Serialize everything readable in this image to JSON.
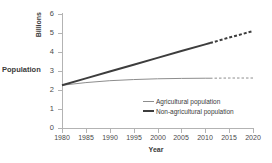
{
  "chart_data": {
    "type": "line",
    "title": "",
    "xlabel": "Year",
    "ylabel": "Population",
    "ylabel_units": "Billions",
    "xlim": [
      1980,
      2020
    ],
    "ylim": [
      0,
      6
    ],
    "grid": false,
    "legend_position": "inside-lower-right",
    "x_ticks": [
      "1980",
      "1985",
      "1990",
      "1995",
      "2000",
      "2005",
      "2010",
      "2015",
      "2020"
    ],
    "y_ticks": [
      "0",
      "1",
      "2",
      "3",
      "4",
      "5",
      "6"
    ],
    "projection_start_year": 2011,
    "x": [
      1980,
      1985,
      1990,
      1995,
      2000,
      2005,
      2010,
      2011,
      2015,
      2020
    ],
    "series": [
      {
        "name": "Agricultural population",
        "color": "#8d8d8d",
        "line_width": 1,
        "values": [
          2.25,
          2.39,
          2.49,
          2.55,
          2.59,
          2.61,
          2.62,
          2.62,
          2.63,
          2.63
        ],
        "solid_until": 2011,
        "dashed_after": true
      },
      {
        "name": "Non-agricultural population",
        "color": "#3d3d3d",
        "line_width": 2,
        "values": [
          2.25,
          2.61,
          2.97,
          3.33,
          3.69,
          4.05,
          4.4,
          4.47,
          4.76,
          5.1
        ],
        "solid_until": 2011,
        "dashed_after": true
      }
    ],
    "legend": [
      "Agricultural population",
      "Non-agricultural population"
    ]
  },
  "axes": {
    "y_title_units": "Billions",
    "y_title_main": "Population",
    "x_title": "Year"
  }
}
